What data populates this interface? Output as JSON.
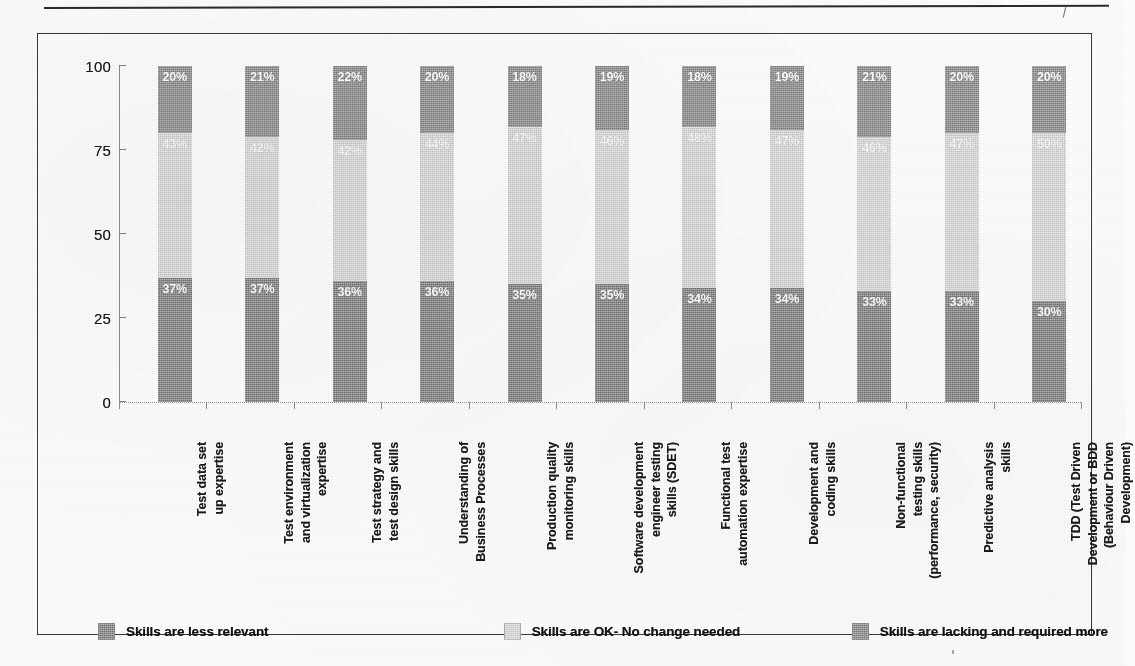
{
  "page": {
    "header_rule": "horizontal-rule",
    "scan_artifact": "speck"
  },
  "chart_data": {
    "type": "bar",
    "subtype": "stacked-percentage",
    "title": "",
    "subtitle": "",
    "xlabel": "",
    "ylabel": "",
    "ylim": [
      0,
      100
    ],
    "yticks": [
      "0",
      "25",
      "50",
      "75",
      "100"
    ],
    "ytick_values": [
      0,
      25,
      50,
      75,
      100
    ],
    "grid": false,
    "legend_position": "bottom",
    "value_suffix": "%",
    "categories": [
      "Test data set\nup expertise",
      "Test environment\nand virtualization\nexpertise",
      "Test strategy and\ntest design skills",
      "Understanding of\nBusiness Processes",
      "Production quality\nmonitoring skills",
      "Software development\nengineer testing\nskills (SDET)",
      "Functional test\nautomation expertise",
      "Development and\ncoding skills",
      "Non-functional\ntesting skills\n(performance, security)",
      "Predictive analysis\nskills",
      "TDD (Test Driven\nDevelopment or BDD\n(Behaviour Driven\nDevelopment)"
    ],
    "category_lines": [
      [
        "Test data set",
        "up expertise"
      ],
      [
        "Test environment",
        "and virtualization",
        "expertise"
      ],
      [
        "Test strategy and",
        "test design skills"
      ],
      [
        "Understanding of",
        "Business Processes"
      ],
      [
        "Production quality",
        "monitoring skills"
      ],
      [
        "Software development",
        "engineer testing",
        "skills (SDET)"
      ],
      [
        "Functional test",
        "automation expertise"
      ],
      [
        "Development and",
        "coding skills"
      ],
      [
        "Non-functional",
        "testing skills",
        "(performance, security)"
      ],
      [
        "Predictive analysis",
        "skills"
      ],
      [
        "TDD (Test Driven",
        "Development or BDD",
        "(Behaviour Driven",
        "Development)"
      ]
    ],
    "series": [
      {
        "name": "Skills are less relevant",
        "key": "low",
        "color": "#6e6e6e",
        "values": [
          37,
          37,
          36,
          36,
          35,
          35,
          34,
          34,
          33,
          33,
          30
        ],
        "labels": [
          "37%",
          "37%",
          "36%",
          "36%",
          "35%",
          "35%",
          "34%",
          "34%",
          "33%",
          "33%",
          "30%"
        ]
      },
      {
        "name": "Skills are OK- No change needed",
        "key": "ok",
        "color": "#d6d6d6",
        "values": [
          43,
          42,
          42,
          44,
          47,
          46,
          48,
          47,
          46,
          47,
          50
        ],
        "labels": [
          "43%",
          "42%",
          "42%",
          "44%",
          "47%",
          "46%",
          "48%",
          "47%",
          "46%",
          "47%",
          "50%"
        ]
      },
      {
        "name": "Skills are lacking and required more",
        "key": "lack",
        "color": "#7b7b7b",
        "values": [
          20,
          21,
          22,
          20,
          18,
          19,
          18,
          19,
          21,
          20,
          20
        ],
        "labels": [
          "20%",
          "21%",
          "22%",
          "20%",
          "18%",
          "19%",
          "18%",
          "19%",
          "21%",
          "20%",
          "20%"
        ]
      }
    ],
    "legend": [
      {
        "label": "Skills are less relevant",
        "color": "#6e6e6e",
        "swatch": "sw-low"
      },
      {
        "label": "Skills are OK- No change needed",
        "color": "#d6d6d6",
        "swatch": "sw-ok"
      },
      {
        "label": "Skills are lacking and required more",
        "color": "#7b7b7b",
        "swatch": "sw-lack"
      }
    ]
  }
}
